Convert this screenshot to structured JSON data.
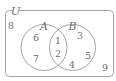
{
  "figure": {
    "type": "venn-diagram",
    "universe_label": "U",
    "set_labels": {
      "A": "A",
      "B": "B"
    },
    "regions": {
      "outside_both": [
        "8",
        "9"
      ],
      "only_A": [
        "6",
        "7"
      ],
      "intersection": [
        "1",
        "2"
      ],
      "only_B": [
        "3",
        "5",
        "4"
      ]
    },
    "elements": [
      {
        "value": "8",
        "region": "outside",
        "x": 11,
        "y": 29
      },
      {
        "value": "6",
        "region": "only-a",
        "x": 36,
        "y": 38
      },
      {
        "value": "7",
        "region": "only-a",
        "x": 36,
        "y": 59
      },
      {
        "value": "1",
        "region": "a-and-b",
        "x": 58,
        "y": 41
      },
      {
        "value": "2",
        "region": "a-and-b",
        "x": 58,
        "y": 54
      },
      {
        "value": "3",
        "region": "only-b",
        "x": 80,
        "y": 36
      },
      {
        "value": "5",
        "region": "only-b",
        "x": 88,
        "y": 56
      },
      {
        "value": "4",
        "region": "only-b",
        "x": 72,
        "y": 65
      },
      {
        "value": "9",
        "region": "outside",
        "x": 105,
        "y": 68
      }
    ],
    "colors": {
      "stroke": "#9a9a9a",
      "text": "#6f6f6f",
      "background": "#ffffff"
    }
  }
}
